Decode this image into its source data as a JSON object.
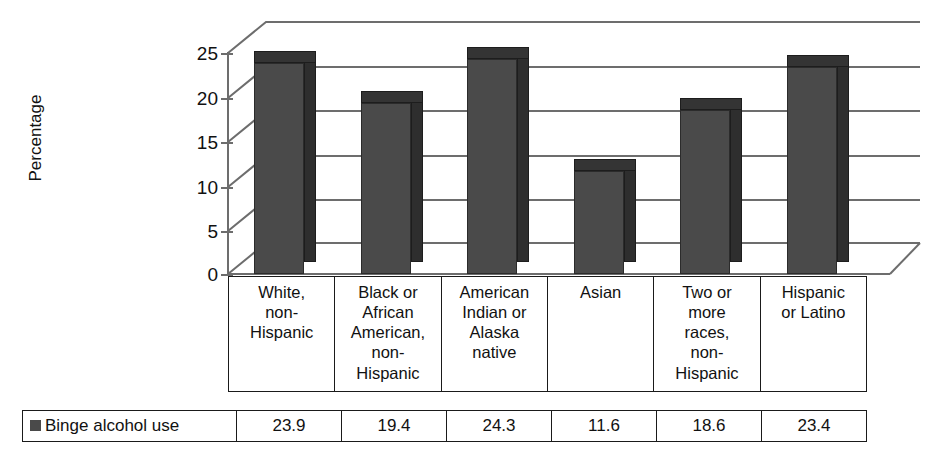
{
  "chart_data": {
    "type": "bar",
    "title": "",
    "subtitle": "",
    "xlabel": "",
    "ylabel": "Percentage",
    "ylim": [
      0,
      25
    ],
    "yticks": [
      0,
      5,
      10,
      15,
      20,
      25
    ],
    "grid": true,
    "three_d": true,
    "legend_position": "bottom-table",
    "categories": [
      "White, non-Hispanic",
      "Black or African American, non-Hispanic",
      "American Indian or Alaska native",
      "Asian",
      "Two or more races, non-Hispanic",
      "Hispanic or Latino"
    ],
    "category_lines": [
      [
        "White,",
        "non-",
        "Hispanic"
      ],
      [
        "Black or",
        "African",
        "American,",
        "non-",
        "Hispanic"
      ],
      [
        "American",
        "Indian or",
        "Alaska",
        "native"
      ],
      [
        "Asian"
      ],
      [
        "Two or",
        "more",
        "races,",
        "non-",
        "Hispanic"
      ],
      [
        "Hispanic",
        "or Latino"
      ]
    ],
    "series": [
      {
        "name": "Binge alcohol use",
        "color": "#4a4a4a",
        "values": [
          23.9,
          19.4,
          24.3,
          11.6,
          18.6,
          23.4
        ],
        "value_labels": [
          "23.9",
          "19.4",
          "24.3",
          "11.6",
          "18.6",
          "23.4"
        ]
      }
    ]
  },
  "axis": {
    "y_title": "Percentage",
    "y_tick_labels": [
      "25",
      "20",
      "15",
      "10",
      "5",
      "0"
    ]
  },
  "legend": {
    "series_label": "Binge alcohol use",
    "swatch_icon": "legend-swatch-icon",
    "swatch_color": "#4a4a4a"
  },
  "colors": {
    "bar_front": "#4a4a4a",
    "bar_side": "#2e2e2e",
    "bar_top": "#343434",
    "gridline": "#6d6d6d",
    "table_border": "#1a1a1a",
    "background": "#ffffff"
  }
}
